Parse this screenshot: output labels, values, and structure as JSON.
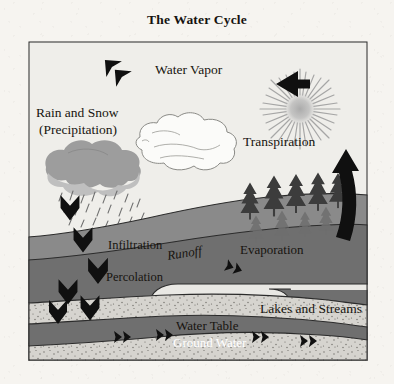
{
  "page": {
    "title": "The Water Cycle",
    "background_color": "#f6f4f0"
  },
  "figure": {
    "frame": {
      "x": 28,
      "y": 41,
      "width": 340,
      "height": 320,
      "border_color": "#2b2b2b"
    },
    "labels": {
      "water_vapor": "Water Vapor",
      "rain_and_snow": "Rain and Snow",
      "precipitation": "(Precipitation)",
      "transpiration": "Transpiration",
      "infiltration": "Infiltration",
      "runoff": "Runoff",
      "evaporation": "Evaporation",
      "percolation": "Percolation",
      "lakes_and_streams": "Lakes and Streams",
      "water_table": "Water Table",
      "ground_water": "Ground Water"
    },
    "elements": {
      "sun": "sun-starburst",
      "vapor_cloud": "white-outlined-cloud",
      "rain_cloud": "gray-rain-cloud",
      "rain_drops": "falling-raindrops",
      "trees": "conifer-tree-row",
      "precipitation_arrow": "down-left-chevron-arrow",
      "vapor_transport_arrow": "left-pointing-arrow",
      "evaporation_arrow": "thick-up-arrow",
      "infiltration_arrows": "down-chevron-arrows",
      "runoff_arrow": "right-down-chevron-arrow",
      "groundwater_arrows": "right-chevron-arrows"
    },
    "colors": {
      "sky": "#efeeea",
      "soil_dark": "#6f6f6f",
      "soil_mid": "#8a8a8a",
      "sand_light": "#d4d2cd",
      "water": "#e8e7e3",
      "cloud_dark": "#9a9a9a",
      "cloud_light": "#bdbdbd",
      "sun": "#9c9c9c",
      "arrow": "#101010",
      "tree": "#3b3b3b",
      "ghost_tree": "#6b6b6b",
      "outline": "#2b2b2b"
    }
  }
}
